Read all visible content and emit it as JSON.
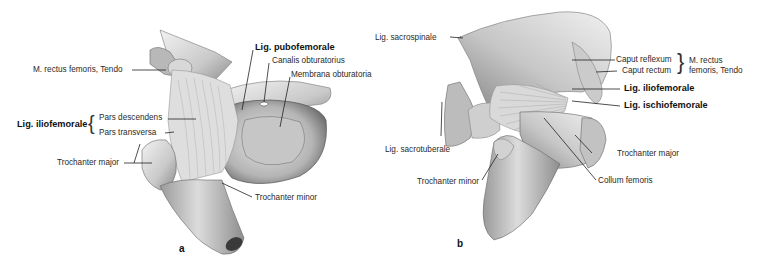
{
  "figure": {
    "panels": [
      {
        "id": "a",
        "letter": "a",
        "labels": {
          "rectus_tendo": "M. rectus femoris, Tendo",
          "lig_pubofemorale": "Lig. pubofemorale",
          "canalis_obturatorius": "Canalis obturatorius",
          "membrana_obturatoria": "Membrana obturatoria",
          "lig_iliofemorale": "Lig. iliofemorale",
          "pars_descendens": "Pars descendens",
          "pars_transversa": "Pars transversa",
          "trochanter_major": "Trochanter major",
          "trochanter_minor": "Trochanter minor"
        }
      },
      {
        "id": "b",
        "letter": "b",
        "labels": {
          "lig_sacrospinale": "Lig. sacrospinale",
          "caput_reflexum": "Caput reflexum",
          "caput_rectum": "Caput rectum",
          "rectus_tendo_line1": "M. rectus",
          "rectus_tendo_line2": "femoris, Tendo",
          "lig_iliofemorale": "Lig. iliofemorale",
          "lig_ischiofemorale": "Lig. ischiofemorale",
          "lig_sacrotuberale": "Lig. sacrotuberale",
          "trochanter_major": "Trochanter major",
          "trochanter_minor": "Trochanter minor",
          "collum_femoris": "Collum femoris"
        }
      }
    ]
  },
  "colors": {
    "bone_light": "#ececec",
    "bone_mid": "#bdbdbd",
    "bone_dark": "#7d7d7d",
    "ligament": "#d6d6d6",
    "leader": "#222222"
  }
}
